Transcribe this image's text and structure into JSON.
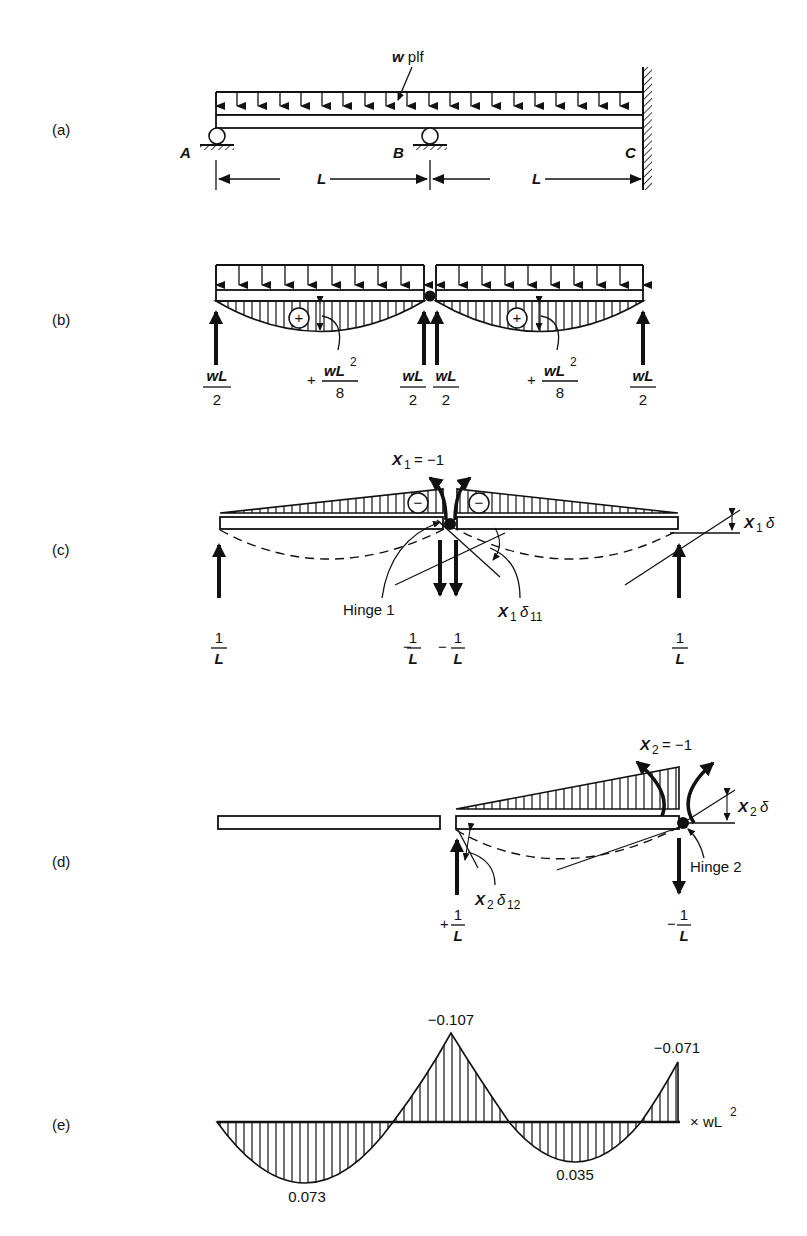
{
  "figure": {
    "panels": [
      {
        "id": "a",
        "label": "(a)",
        "load_label": "w plf",
        "supports": {
          "A": "A",
          "B": "B",
          "C": "C"
        },
        "dimensions": [
          "L",
          "L"
        ]
      },
      {
        "id": "b",
        "label": "(b)",
        "moment_sign": "+",
        "moment_left": {
          "sign": "+",
          "num": "wL",
          "sup": "2",
          "den": "8"
        },
        "moment_right": {
          "sign": "+",
          "num": "wL",
          "sup": "2",
          "den": "8"
        },
        "reactions": [
          {
            "num": "wL",
            "den": "2"
          },
          {
            "num": "wL",
            "den": "2"
          },
          {
            "num": "wL",
            "den": "2"
          },
          {
            "num": "wL",
            "den": "2"
          }
        ]
      },
      {
        "id": "c",
        "label": "(c)",
        "redundant": "X",
        "redundant_sub": "1",
        "redundant_value": "= −1",
        "moment_sign": "−",
        "hinge_label": "Hinge 1",
        "rotation_label": {
          "main": "X",
          "sub": "1",
          "delta": "δ",
          "delta_sub": "11"
        },
        "right_rotation_label": {
          "main": "X",
          "sub": "1",
          "delta": "δ"
        },
        "reactions": [
          {
            "sign": "",
            "num": "1",
            "den": "L"
          },
          {
            "sign": "−",
            "num": "1",
            "den": "L"
          },
          {
            "sign": "−",
            "num": "1",
            "den": "L"
          },
          {
            "sign": "",
            "num": "1",
            "den": "L"
          }
        ]
      },
      {
        "id": "d",
        "label": "(d)",
        "redundant": "X",
        "redundant_sub": "2",
        "redundant_value": "= −1",
        "hinge_label": "Hinge 2",
        "rotation_label": {
          "main": "X",
          "sub": "2",
          "delta": "δ",
          "delta_sub": "12"
        },
        "right_rotation_label": {
          "main": "X",
          "sub": "2",
          "delta": "δ"
        },
        "reactions": [
          {
            "sign": "+",
            "num": "1",
            "den": "L"
          },
          {
            "sign": "−",
            "num": "1",
            "den": "L"
          }
        ]
      },
      {
        "id": "e",
        "label": "(e)",
        "unit_label": {
          "prefix": "× wL",
          "sup": "2"
        },
        "values": {
          "max_positive_span1": "0.073",
          "support_B": "−0.107",
          "max_positive_span2": "0.035",
          "support_C": "−0.071"
        }
      }
    ]
  }
}
